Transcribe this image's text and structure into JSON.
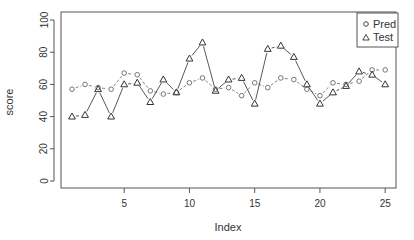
{
  "chart_data": {
    "type": "line",
    "title": "",
    "xlabel": "Index",
    "ylabel": "score",
    "xlim": [
      1,
      25
    ],
    "ylim": [
      0,
      100
    ],
    "x_ticks": [
      5,
      10,
      15,
      20,
      25
    ],
    "y_ticks": [
      0,
      20,
      40,
      60,
      80,
      100
    ],
    "grid": false,
    "legend_position": "top-right",
    "x": [
      1,
      2,
      3,
      4,
      5,
      6,
      7,
      8,
      9,
      10,
      11,
      12,
      13,
      14,
      15,
      16,
      17,
      18,
      19,
      20,
      21,
      22,
      23,
      24,
      25
    ],
    "series": [
      {
        "name": "Pred",
        "marker": "circle",
        "line": "dashed",
        "values": [
          57,
          60,
          58,
          57,
          67,
          66,
          56,
          54,
          55,
          61,
          64,
          57,
          58,
          53,
          61,
          58,
          64,
          63,
          57,
          53,
          61,
          60,
          62,
          69,
          69
        ]
      },
      {
        "name": "Test",
        "marker": "triangle",
        "line": "solid-dashed",
        "values": [
          40,
          41,
          57,
          40,
          60,
          61,
          49,
          63,
          55,
          76,
          86,
          56,
          63,
          64,
          48,
          82,
          84,
          77,
          60,
          48,
          55,
          59,
          68,
          66,
          60
        ]
      }
    ]
  },
  "legend": {
    "items": [
      {
        "label": "Pred",
        "symbol": "○"
      },
      {
        "label": "Test",
        "symbol": "△"
      }
    ]
  },
  "axes": {
    "xlabel": "Index",
    "ylabel": "score",
    "x_tick_labels": [
      "5",
      "10",
      "15",
      "20",
      "25"
    ],
    "y_tick_labels": [
      "0",
      "20",
      "40",
      "60",
      "80",
      "100"
    ]
  },
  "colors": {
    "frame": "#555555",
    "series": "#333333",
    "background": "#ffffff"
  }
}
